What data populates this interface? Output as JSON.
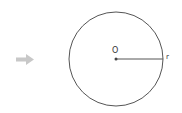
{
  "diagram": {
    "type": "circle-with-radius",
    "center_label": "O",
    "radius_label": "r",
    "arrow_icon": "right-arrow-icon",
    "colors": {
      "stroke": "#555555",
      "arrow": "#c8c8c8",
      "background": "#ffffff"
    },
    "circle": {
      "cx": 116,
      "cy": 59,
      "r": 47
    }
  }
}
